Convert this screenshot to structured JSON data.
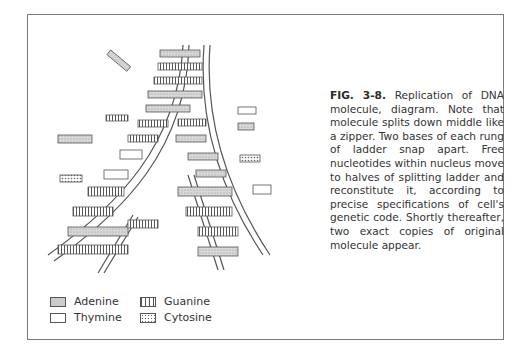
{
  "figure": {
    "label": "FIG. 3-8.",
    "caption": "Replication of DNA molecule, diagram. Note that molecule splits down middle like a zipper. Two bases of each rung of ladder snap apart. Free nucleotides within nucleus move to halves of splitting ladder and reconstitute it, according to precise specifications of cell's genetic code. Shortly thereafter, two exact copies of original molecule appear."
  },
  "legend": {
    "items": [
      {
        "label": "Adenine",
        "pattern": "stipple"
      },
      {
        "label": "Guanine",
        "pattern": "vertical-stripes"
      },
      {
        "label": "Thymine",
        "pattern": "blank"
      },
      {
        "label": "Cytosine",
        "pattern": "dots"
      }
    ]
  },
  "colors": {
    "ink": "#555555",
    "fill": "#cfcfcf",
    "border": "#7a7a7a"
  }
}
